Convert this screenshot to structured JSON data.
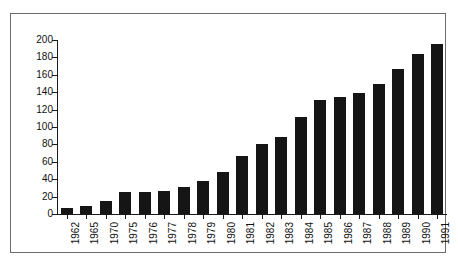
{
  "chart_data": {
    "type": "bar",
    "title": "",
    "subtitle": "",
    "xlabel": "",
    "ylabel": "",
    "categories": [
      "1962",
      "1965",
      "1970",
      "1975",
      "1976",
      "1977",
      "1978",
      "1979",
      "1980",
      "1981",
      "1982",
      "1983",
      "1984",
      "1985",
      "1986",
      "1987",
      "1988",
      "1989",
      "1990",
      "1991"
    ],
    "values": [
      7,
      9,
      15,
      25,
      25,
      27,
      31,
      38,
      48,
      67,
      81,
      88,
      112,
      131,
      134,
      139,
      150,
      167,
      184,
      195
    ],
    "series": [
      {
        "name": "",
        "values": [
          7,
          9,
          15,
          25,
          25,
          27,
          31,
          38,
          48,
          67,
          81,
          88,
          112,
          131,
          134,
          139,
          150,
          167,
          184,
          195
        ]
      }
    ],
    "ylim": [
      0,
      200
    ],
    "y_ticks": [
      0,
      20,
      40,
      60,
      80,
      100,
      120,
      140,
      160,
      180,
      200
    ],
    "y_tick_labels": [
      "0",
      "20",
      "40",
      "60",
      "80",
      "100",
      "120",
      "140",
      "160",
      "180",
      "200"
    ],
    "x_tick_labels": [
      "1962",
      "1965",
      "1970",
      "1975",
      "1976",
      "1977",
      "1978",
      "1979",
      "1980",
      "1981",
      "1982",
      "1983",
      "1984",
      "1985",
      "1986",
      "1987",
      "1988",
      "1989",
      "1990",
      "1991"
    ],
    "grid": false,
    "legend": false,
    "legend_position": "none",
    "bar_color": "#151515",
    "axis_color": "#1a1a1a",
    "frame_color": "#6b6b6b",
    "background_color": "#ffffff",
    "x_label_rotation": -90
  }
}
